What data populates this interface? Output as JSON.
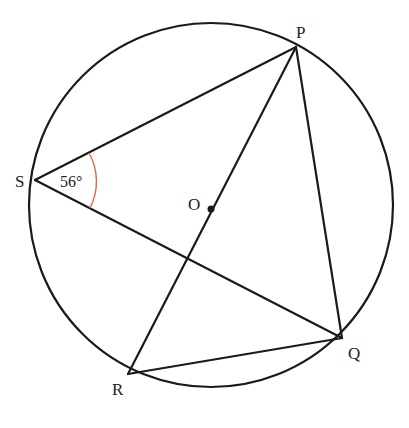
{
  "diagram": {
    "circle": {
      "center": "O",
      "cx": 211,
      "cy": 205,
      "r": 182
    },
    "points": {
      "P": {
        "label": "P",
        "x": 296,
        "y": 47
      },
      "Q": {
        "label": "Q",
        "x": 342,
        "y": 338
      },
      "R": {
        "label": "R",
        "x": 128,
        "y": 374
      },
      "S": {
        "label": "S",
        "x": 35,
        "y": 180
      },
      "O": {
        "label": "O",
        "x": 211,
        "y": 209
      }
    },
    "segments": [
      "SP",
      "PQ",
      "QR",
      "RP",
      "SQ"
    ],
    "angle": {
      "vertex": "S",
      "between": [
        "SP",
        "SQ"
      ],
      "value": "56°",
      "arc_color": "#e0673a"
    },
    "line_color": "#1a1a1a"
  }
}
